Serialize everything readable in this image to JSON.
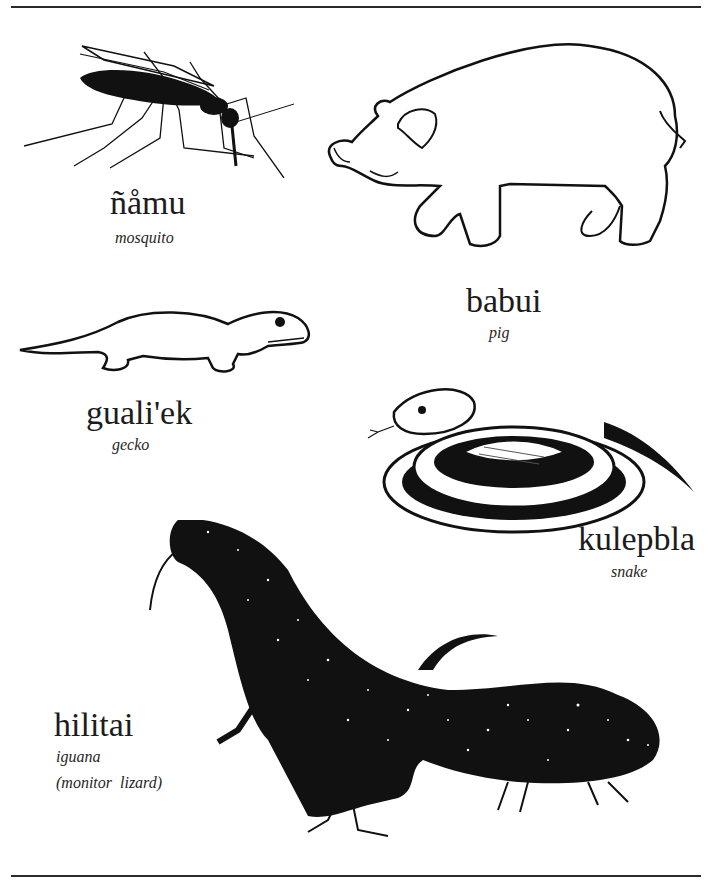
{
  "page": {
    "rules": [
      "top-rule",
      "bottom-rule"
    ]
  },
  "entries": [
    {
      "id": "mosquito",
      "word": "ñåmu",
      "gloss": "mosquito",
      "illustration": "mosquito-drawing"
    },
    {
      "id": "pig",
      "word": "babui",
      "gloss": "pig",
      "illustration": "pig-drawing"
    },
    {
      "id": "gecko",
      "word": "guali'ek",
      "gloss": "gecko",
      "illustration": "gecko-drawing"
    },
    {
      "id": "snake",
      "word": "kulepbla",
      "gloss": "snake",
      "illustration": "snake-drawing"
    },
    {
      "id": "iguana",
      "word": "hilitai",
      "gloss": "iguana",
      "gloss_extra": "(monitor  lizard)",
      "illustration": "monitor-lizard-drawing"
    }
  ],
  "colors": {
    "ink": "#1a1a1a",
    "paper": "#ffffff"
  }
}
